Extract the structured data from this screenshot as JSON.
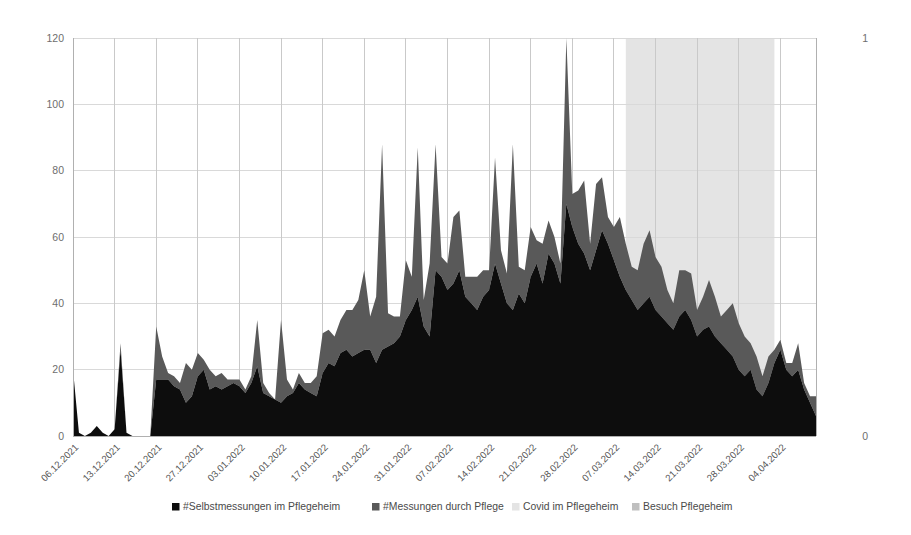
{
  "chart_data": {
    "type": "area",
    "title": "",
    "subtitle": "",
    "xlabel": "",
    "ylabel": "",
    "ylim": [
      0,
      120
    ],
    "y2lim": [
      0,
      1
    ],
    "grid": true,
    "legend_position": "bottom",
    "yticks": [
      "0",
      "20",
      "40",
      "60",
      "80",
      "100",
      "120"
    ],
    "ytick_values": [
      0,
      20,
      40,
      60,
      80,
      100,
      120
    ],
    "y2ticks": [
      "0",
      "1"
    ],
    "y2tick_values": [
      0,
      1
    ],
    "xtick_labels": [
      "06.12.2021",
      "13.12.2021",
      "20.12.2021",
      "27.12.2021",
      "03.01.2022",
      "10.01.2022",
      "17.01.2022",
      "24.01.2022",
      "31.01.2022",
      "07.02.2022",
      "14.02.2022",
      "21.02.2022",
      "28.02.2022",
      "07.03.2022",
      "14.03.2022",
      "21.03.2022",
      "28.03.2022",
      "04.04.2022"
    ],
    "xtick_day_index": [
      0,
      7,
      14,
      21,
      28,
      35,
      42,
      49,
      56,
      63,
      70,
      77,
      84,
      91,
      98,
      105,
      112,
      119
    ],
    "series": [
      {
        "name": "#Selbstmessungen im Pflegeheim",
        "color": "#0d0d0d",
        "stack": "bottom",
        "values": [
          20,
          1,
          0,
          1,
          3,
          1,
          0,
          2,
          26,
          1,
          0,
          0,
          0,
          0,
          17,
          17,
          17,
          15,
          14,
          10,
          12,
          18,
          20,
          14,
          15,
          14,
          15,
          16,
          15,
          13,
          16,
          21,
          13,
          12,
          11,
          10,
          12,
          13,
          16,
          14,
          13,
          12,
          19,
          22,
          21,
          25,
          26,
          24,
          25,
          26,
          26,
          22,
          26,
          27,
          28,
          30,
          35,
          38,
          42,
          33,
          30,
          50,
          48,
          44,
          46,
          50,
          42,
          40,
          38,
          42,
          44,
          52,
          46,
          40,
          38,
          43,
          40,
          48,
          52,
          46,
          55,
          52,
          46,
          70,
          63,
          58,
          55,
          50,
          56,
          62,
          58,
          53,
          48,
          44,
          41,
          38,
          40,
          42,
          38,
          36,
          34,
          32,
          36,
          38,
          35,
          30,
          32,
          33,
          30,
          28,
          26,
          24,
          20,
          18,
          20,
          14,
          12,
          16,
          22,
          26,
          20,
          18,
          20,
          14,
          10,
          6
        ]
      },
      {
        "name": "#Messungen durch Pflege",
        "color": "#595959",
        "stack": "top",
        "values": [
          0,
          0,
          0,
          0,
          0,
          0,
          0,
          0,
          2,
          0,
          0,
          0,
          0,
          0,
          16,
          7,
          2,
          3,
          2,
          12,
          8,
          7,
          3,
          6,
          3,
          5,
          2,
          1,
          2,
          1,
          2,
          14,
          3,
          1,
          0,
          25,
          5,
          1,
          3,
          2,
          3,
          6,
          12,
          10,
          9,
          10,
          12,
          14,
          16,
          24,
          10,
          20,
          62,
          10,
          8,
          6,
          18,
          10,
          45,
          8,
          22,
          38,
          6,
          8,
          20,
          18,
          6,
          8,
          10,
          8,
          6,
          32,
          10,
          9,
          50,
          8,
          10,
          15,
          7,
          12,
          10,
          8,
          6,
          50,
          10,
          16,
          22,
          8,
          20,
          16,
          8,
          10,
          18,
          14,
          10,
          12,
          18,
          20,
          16,
          15,
          10,
          8,
          14,
          12,
          14,
          8,
          10,
          14,
          12,
          8,
          12,
          16,
          14,
          12,
          8,
          10,
          6,
          8,
          4,
          3,
          2,
          4,
          8,
          2,
          2,
          6
        ]
      }
    ],
    "bands": [
      {
        "name": "Covid im Pflegeheim",
        "color": "#e4e4e4",
        "start_day": 93,
        "end_day": 118,
        "value": 1
      },
      {
        "name": "Besuch Pflegeheim",
        "color": "#a6a6a6",
        "start_day": 0,
        "end_day": 0,
        "value": 0
      }
    ],
    "legend": [
      {
        "label": "#Selbstmessungen im Pflegeheim",
        "color": "#0d0d0d"
      },
      {
        "label": "#Messungen durch Pflege",
        "color": "#595959"
      },
      {
        "label": "Covid im Pflegeheim",
        "color": "#e4e4e4"
      },
      {
        "label": "Besuch Pflegeheim",
        "color": "#bfbfbf"
      }
    ]
  }
}
